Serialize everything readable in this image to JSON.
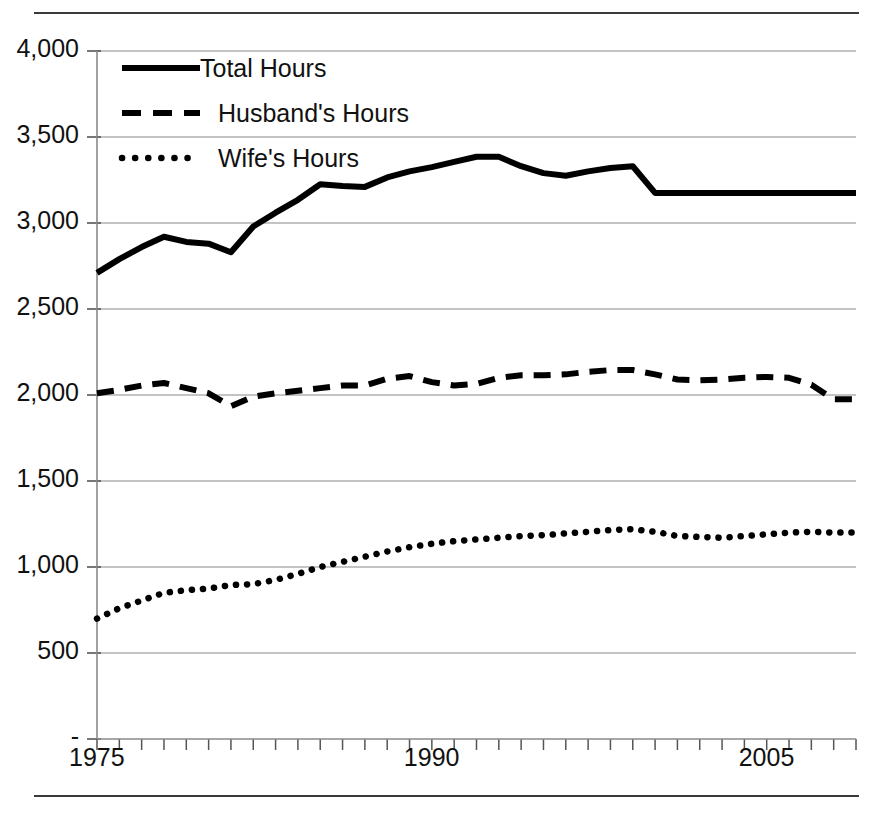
{
  "chart_data": {
    "type": "line",
    "title": "",
    "subtitle": "",
    "xlabel": "",
    "ylabel": "",
    "xlim": [
      1975,
      2009
    ],
    "ylim": [
      0,
      4000
    ],
    "grid": true,
    "legend_position": "top-left",
    "y_ticks": [
      0,
      500,
      1000,
      1500,
      2000,
      2500,
      3000,
      3500,
      4000
    ],
    "y_tick_labels": [
      "-",
      "500",
      "1,000",
      "1,500",
      "2,000",
      "2,500",
      "3,000",
      "3,500",
      "4,000"
    ],
    "x_ticks": [
      1975,
      1990,
      2005
    ],
    "x_tick_labels": [
      "1975",
      "1990",
      "2005"
    ],
    "x_minor_tick_interval": 1,
    "x": [
      1975,
      1976,
      1977,
      1978,
      1979,
      1980,
      1981,
      1982,
      1983,
      1984,
      1985,
      1986,
      1987,
      1988,
      1989,
      1990,
      1991,
      1992,
      1993,
      1994,
      1995,
      1996,
      1997,
      1998,
      1999,
      2000,
      2001,
      2002,
      2003,
      2004,
      2005,
      2006,
      2007,
      2008,
      2009
    ],
    "series": [
      {
        "name": "Total  Hours",
        "style": "solid",
        "color": "#000000",
        "values": [
          2710,
          2790,
          2860,
          2920,
          2890,
          2880,
          2830,
          2980,
          3060,
          3135,
          3225,
          3215,
          3210,
          3265,
          3300,
          3325,
          3355,
          3385,
          3385,
          3330,
          3290,
          3275,
          3300,
          3320,
          3330,
          3175,
          3175,
          3175,
          3175,
          3175,
          3175,
          3175,
          3175,
          3175,
          3175
        ]
      },
      {
        "name": "Husband's Hours",
        "style": "dashed",
        "color": "#000000",
        "values": [
          2010,
          2030,
          2055,
          2070,
          2040,
          2010,
          1935,
          1990,
          2010,
          2025,
          2040,
          2055,
          2055,
          2095,
          2110,
          2075,
          2055,
          2065,
          2100,
          2115,
          2115,
          2120,
          2135,
          2145,
          2145,
          2120,
          2090,
          2085,
          2090,
          2100,
          2105,
          2100,
          2060,
          1975,
          1975
        ]
      },
      {
        "name": "Wife's Hours",
        "style": "dotted",
        "color": "#000000",
        "values": [
          700,
          760,
          805,
          850,
          865,
          875,
          895,
          900,
          925,
          960,
          1000,
          1030,
          1060,
          1090,
          1115,
          1135,
          1150,
          1160,
          1170,
          1180,
          1185,
          1195,
          1205,
          1215,
          1220,
          1205,
          1180,
          1175,
          1170,
          1180,
          1190,
          1200,
          1205,
          1200,
          1200
        ]
      }
    ],
    "legend": [
      {
        "label": "Total  Hours",
        "style": "solid"
      },
      {
        "label": "Husband's Hours",
        "style": "dashed"
      },
      {
        "label": "Wife's Hours",
        "style": "dotted"
      }
    ]
  }
}
